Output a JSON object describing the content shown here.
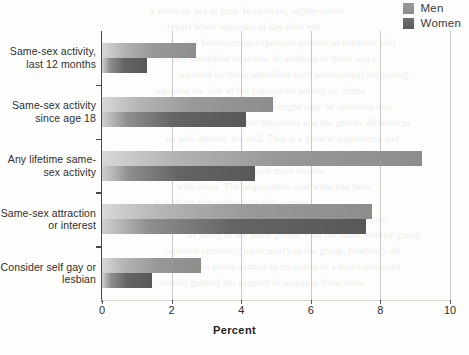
{
  "legend": {
    "position": "top-right",
    "entries": [
      {
        "label": "Men",
        "color": "#989896"
      },
      {
        "label": "Women",
        "color": "#646462"
      }
    ]
  },
  "axis": {
    "xlabel": "Percent",
    "xticks": [
      "0",
      "2",
      "4",
      "6",
      "8",
      "10"
    ]
  },
  "ghost_text": [
    "a week by sex in grid. In contrast, eighty-seven",
    "report fewer episodes of day than one",
    "and heterosexual expressed interest in behavior still",
    "in self-identified relations. In addition of these ways",
    "reported by those identified such homosexual increasing",
    "reported the size of the population among us. Some",
    "of the difficulty involved might only be selection bias",
    "in one to another behaviors and the gender differences",
    "on self-identity are still. This is a general experience and",
    "the consistent in its position in sexual activity with both",
    "been found a small support more results",
    "with ideas. The respondents said what had been",
    "it is likely that subjects in this sample",
    "by self classification and identified somewhat sexual",
    "as being in the same gender with the same activity group",
    "reported currently, particularly in the group, relatively all",
    "the the entire sample to measures to a much less hard",
    "overall general but support of response from these"
  ],
  "chart_data": {
    "type": "bar",
    "orientation": "horizontal",
    "title": "",
    "xlabel": "Percent",
    "ylabel": "",
    "xlim": [
      0,
      10
    ],
    "grid": true,
    "categories": [
      "Same-sex activity,\nlast 12 months",
      "Same-sex activity\nsince age 18",
      "Any lifetime same-\nsex activity",
      "Same-sex attraction\nor interest",
      "Consider self gay or\nlesbian"
    ],
    "series": [
      {
        "name": "Men",
        "values": [
          2.7,
          4.9,
          9.2,
          7.75,
          2.85
        ]
      },
      {
        "name": "Women",
        "values": [
          1.3,
          4.15,
          4.4,
          7.6,
          1.45
        ]
      }
    ]
  }
}
